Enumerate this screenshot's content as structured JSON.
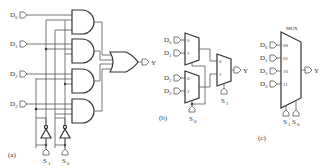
{
  "panel_a": {
    "caption": "(a)",
    "inputs": [
      {
        "label": "D",
        "sub": "0"
      },
      {
        "label": "D",
        "sub": "1"
      },
      {
        "label": "D",
        "sub": "2"
      },
      {
        "label": "D",
        "sub": "3"
      }
    ],
    "selects": [
      {
        "label": "S",
        "sub": "1"
      },
      {
        "label": "S",
        "sub": "0"
      }
    ],
    "output": "Y"
  },
  "panel_b": {
    "caption": "(b)",
    "inputs": [
      {
        "label": "D",
        "sub": "0"
      },
      {
        "label": "D",
        "sub": "1"
      },
      {
        "label": "D",
        "sub": "2"
      },
      {
        "label": "D",
        "sub": "3"
      }
    ],
    "mux_pin_labels": [
      "0",
      "1"
    ],
    "select_first": {
      "label": "S",
      "sub": "0"
    },
    "select_second": {
      "label": "S",
      "sub": "1"
    },
    "output": "Y"
  },
  "panel_c": {
    "caption": "(c)",
    "title": "MUX",
    "inputs": [
      {
        "label": "D",
        "sub": "0",
        "code": "00"
      },
      {
        "label": "D",
        "sub": "1",
        "code": "01"
      },
      {
        "label": "D",
        "sub": "2",
        "code": "10"
      },
      {
        "label": "D",
        "sub": "3",
        "code": "11"
      }
    ],
    "selects": [
      {
        "label": "S",
        "sub": "1"
      },
      {
        "label": "S",
        "sub": "0"
      }
    ],
    "output": "Y"
  }
}
